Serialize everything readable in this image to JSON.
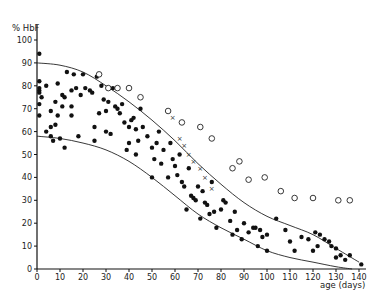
{
  "chart_data": {
    "type": "scatter",
    "title": "",
    "xlabel": "age (days)",
    "ylabel": "% HbF",
    "xlim": [
      0,
      140
    ],
    "ylim": [
      0,
      100
    ],
    "x_ticks": [
      0,
      10,
      20,
      30,
      40,
      50,
      60,
      70,
      80,
      90,
      100,
      110,
      120,
      130,
      140
    ],
    "y_ticks": [
      0,
      10,
      20,
      30,
      40,
      50,
      60,
      70,
      80,
      90,
      100
    ],
    "grid": false,
    "legend": null,
    "series": [
      {
        "name": "filled-dots",
        "marker": "filled-circle",
        "points": [
          [
            1,
            94
          ],
          [
            1,
            82
          ],
          [
            1,
            79
          ],
          [
            1,
            78
          ],
          [
            1,
            77
          ],
          [
            1,
            72
          ],
          [
            1,
            67
          ],
          [
            2,
            75
          ],
          [
            4,
            60
          ],
          [
            4,
            80
          ],
          [
            6,
            69
          ],
          [
            6,
            62
          ],
          [
            6,
            58
          ],
          [
            7,
            56
          ],
          [
            8,
            73
          ],
          [
            8,
            63
          ],
          [
            9,
            67
          ],
          [
            9,
            81
          ],
          [
            10,
            57
          ],
          [
            11,
            71
          ],
          [
            11,
            76
          ],
          [
            12,
            53
          ],
          [
            12,
            75
          ],
          [
            13,
            86
          ],
          [
            15,
            78
          ],
          [
            15,
            71
          ],
          [
            15,
            67
          ],
          [
            16,
            85
          ],
          [
            17,
            79
          ],
          [
            18,
            58
          ],
          [
            19,
            76
          ],
          [
            20,
            85
          ],
          [
            21,
            79
          ],
          [
            23,
            78
          ],
          [
            24,
            77
          ],
          [
            25,
            56
          ],
          [
            25,
            62
          ],
          [
            26,
            84
          ],
          [
            27,
            68
          ],
          [
            28,
            80
          ],
          [
            29,
            74
          ],
          [
            30,
            60
          ],
          [
            30,
            69
          ],
          [
            31,
            73
          ],
          [
            32,
            59
          ],
          [
            33,
            79
          ],
          [
            34,
            71
          ],
          [
            35,
            70
          ],
          [
            36,
            68
          ],
          [
            37,
            72
          ],
          [
            38,
            64
          ],
          [
            39,
            52
          ],
          [
            40,
            55
          ],
          [
            40,
            62
          ],
          [
            41,
            65
          ],
          [
            42,
            66
          ],
          [
            43,
            61
          ],
          [
            43,
            50
          ],
          [
            44,
            56
          ],
          [
            45,
            70
          ],
          [
            46,
            62
          ],
          [
            48,
            58
          ],
          [
            50,
            53
          ],
          [
            50,
            40
          ],
          [
            51,
            48
          ],
          [
            52,
            55
          ],
          [
            53,
            60
          ],
          [
            54,
            46
          ],
          [
            55,
            52
          ],
          [
            57,
            40
          ],
          [
            58,
            55
          ],
          [
            59,
            48
          ],
          [
            60,
            45
          ],
          [
            61,
            41
          ],
          [
            62,
            50
          ],
          [
            63,
            38
          ],
          [
            64,
            36
          ],
          [
            65,
            26
          ],
          [
            66,
            44
          ],
          [
            67,
            32
          ],
          [
            68,
            31
          ],
          [
            69,
            30
          ],
          [
            70,
            36
          ],
          [
            71,
            22
          ],
          [
            72,
            34
          ],
          [
            73,
            29
          ],
          [
            74,
            28
          ],
          [
            75,
            24
          ],
          [
            76,
            38
          ],
          [
            77,
            25
          ],
          [
            78,
            18
          ],
          [
            80,
            26
          ],
          [
            81,
            30
          ],
          [
            82,
            29
          ],
          [
            84,
            21
          ],
          [
            85,
            15
          ],
          [
            86,
            25
          ],
          [
            87,
            17
          ],
          [
            89,
            13
          ],
          [
            90,
            20
          ],
          [
            92,
            16
          ],
          [
            94,
            18
          ],
          [
            95,
            18
          ],
          [
            96,
            10
          ],
          [
            97,
            17
          ],
          [
            98,
            14
          ],
          [
            100,
            8
          ],
          [
            100,
            15
          ],
          [
            104,
            22
          ],
          [
            108,
            17
          ],
          [
            110,
            12
          ],
          [
            112,
            8
          ],
          [
            115,
            14
          ],
          [
            118,
            13
          ],
          [
            120,
            8
          ],
          [
            121,
            16
          ],
          [
            122,
            10
          ],
          [
            123,
            15
          ],
          [
            125,
            13
          ],
          [
            127,
            12
          ],
          [
            128,
            10
          ],
          [
            130,
            9
          ],
          [
            130,
            5
          ],
          [
            132,
            6
          ],
          [
            134,
            4
          ],
          [
            136,
            6
          ],
          [
            141,
            2
          ]
        ]
      },
      {
        "name": "open-circles",
        "marker": "open-circle",
        "points": [
          [
            27,
            85
          ],
          [
            31,
            79
          ],
          [
            35,
            79
          ],
          [
            40,
            79
          ],
          [
            45,
            75
          ],
          [
            57,
            69
          ],
          [
            63,
            64
          ],
          [
            71,
            62
          ],
          [
            76,
            57
          ],
          [
            85,
            44
          ],
          [
            88,
            47
          ],
          [
            92,
            39
          ],
          [
            99,
            40
          ],
          [
            106,
            34
          ],
          [
            112,
            31
          ],
          [
            120,
            31
          ],
          [
            131,
            30
          ],
          [
            136,
            30
          ]
        ]
      },
      {
        "name": "crosses",
        "marker": "x",
        "points": [
          [
            59,
            66
          ],
          [
            62,
            57
          ],
          [
            64,
            54
          ],
          [
            66,
            50
          ],
          [
            68,
            47
          ],
          [
            71,
            44
          ],
          [
            73,
            40
          ],
          [
            76,
            35
          ]
        ]
      }
    ],
    "curves": [
      {
        "name": "upper-envelope",
        "points": [
          [
            0,
            90
          ],
          [
            10,
            89
          ],
          [
            20,
            86
          ],
          [
            30,
            80
          ],
          [
            40,
            73
          ],
          [
            50,
            65
          ],
          [
            60,
            56
          ],
          [
            70,
            46
          ],
          [
            80,
            37
          ],
          [
            90,
            29
          ],
          [
            100,
            23
          ],
          [
            110,
            19
          ],
          [
            120,
            15
          ],
          [
            130,
            9
          ],
          [
            140,
            3
          ]
        ]
      },
      {
        "name": "lower-envelope",
        "points": [
          [
            0,
            58
          ],
          [
            10,
            57
          ],
          [
            20,
            55
          ],
          [
            30,
            52
          ],
          [
            40,
            47
          ],
          [
            50,
            40
          ],
          [
            60,
            32
          ],
          [
            70,
            24
          ],
          [
            80,
            18
          ],
          [
            90,
            13
          ],
          [
            100,
            8
          ],
          [
            110,
            5
          ],
          [
            120,
            3
          ],
          [
            130,
            1
          ],
          [
            137,
            0
          ]
        ]
      }
    ]
  }
}
